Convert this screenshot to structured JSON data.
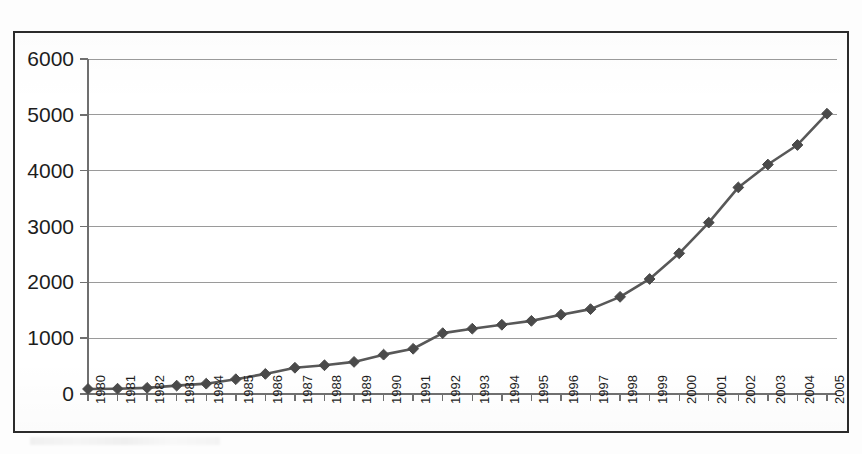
{
  "chart_data": {
    "type": "line",
    "title": "",
    "subtitle": "",
    "xlabel": "",
    "ylabel": "",
    "grid": true,
    "legend": false,
    "legend_position": "none",
    "marker": "diamond",
    "series_color": "#585858",
    "xlim": [
      1980,
      2005
    ],
    "ylim": [
      0,
      6000
    ],
    "ytick_labels": [
      "6000",
      "5000",
      "4000",
      "3000",
      "2000",
      "1000",
      "0"
    ],
    "yticks": [
      6000,
      5000,
      4000,
      3000,
      2000,
      1000,
      0
    ],
    "categories": [
      "1980",
      "1981",
      "1982",
      "1983",
      "1984",
      "1985",
      "1986",
      "1987",
      "1988",
      "1989",
      "1990",
      "1991",
      "1992",
      "1993",
      "1994",
      "1995",
      "1996",
      "1997",
      "1998",
      "1999",
      "2000",
      "2001",
      "2002",
      "2003",
      "2004",
      "2005"
    ],
    "values": [
      90,
      95,
      110,
      150,
      185,
      265,
      360,
      470,
      515,
      575,
      705,
      810,
      1090,
      1170,
      1240,
      1310,
      1420,
      1520,
      1740,
      2060,
      2520,
      3070,
      3700,
      4110,
      4460,
      5020
    ],
    "series": [
      {
        "name": "series-1",
        "values": [
          90,
          95,
          110,
          150,
          185,
          265,
          360,
          470,
          515,
          575,
          705,
          810,
          1090,
          1170,
          1240,
          1310,
          1420,
          1520,
          1740,
          2060,
          2520,
          3070,
          3700,
          4110,
          4460,
          5020
        ]
      }
    ]
  },
  "style": {
    "frame_color": "#2b2b2b",
    "grid_color": "#9a9a9a",
    "axis_color": "#6f6f6f",
    "line_color": "#585858",
    "marker_color": "#4a4a4a",
    "text_color": "#1d1d1d",
    "background": "#ffffff"
  }
}
